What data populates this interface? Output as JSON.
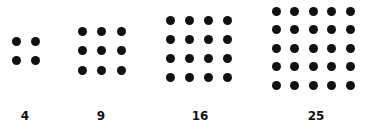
{
  "figure": {
    "dot_color": "#111111",
    "background": "#ffffff",
    "arrays": [
      {
        "label": "4",
        "rows": 2,
        "cols": 2,
        "x0": 16,
        "y0": 41,
        "step": 19.5,
        "label_x": 25
      },
      {
        "label": "9",
        "rows": 3,
        "cols": 3,
        "x0": 82,
        "y0": 31,
        "step": 19.5,
        "label_x": 101
      },
      {
        "label": "16",
        "rows": 4,
        "cols": 4,
        "x0": 170,
        "y0": 20,
        "step": 19.2,
        "label_x": 200
      },
      {
        "label": "25",
        "rows": 5,
        "cols": 5,
        "x0": 276,
        "y0": 11,
        "step": 18.6,
        "label_x": 316
      }
    ],
    "label_y": 110
  }
}
